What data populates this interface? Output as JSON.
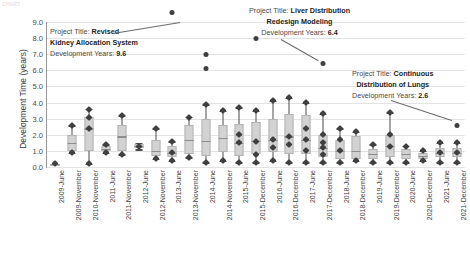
{
  "corner_text": "CHART",
  "chart_data": {
    "type": "box",
    "title": "",
    "xlabel": "",
    "ylabel": "Development Time (years)",
    "ylim": [
      0.0,
      9.0
    ],
    "yticks": [
      "0.0",
      "1.0",
      "2.0",
      "3.0",
      "4.0",
      "5.0",
      "6.0",
      "7.0",
      "8.0",
      "9.0"
    ],
    "grid": true,
    "legend": "none",
    "categories": [
      "2009-June",
      "2009-November",
      "2010-November",
      "2011-June",
      "2011-November",
      "2012-June",
      "2012-November",
      "2013-June",
      "2013-November",
      "2014-June",
      "2014-November",
      "2015-June",
      "2015-December",
      "2016-June",
      "2016-December",
      "2017-June",
      "2017-December",
      "2018-June",
      "2018-December",
      "2019-June",
      "2019-December",
      "2020-June",
      "2020-December",
      "2021-June",
      "2021-December"
    ],
    "boxes": [
      {
        "category": "2009-June",
        "whisker_low": 0.2,
        "q1": 0.2,
        "median": 0.2,
        "q3": 0.2,
        "whisker_high": 0.2,
        "points": [
          0.2
        ]
      },
      {
        "category": "2009-November",
        "whisker_low": 0.9,
        "q1": 1.0,
        "median": 1.5,
        "q3": 2.0,
        "whisker_high": 2.6,
        "points": [
          0.9,
          2.6
        ]
      },
      {
        "category": "2010-November",
        "whisker_low": 0.2,
        "q1": 1.0,
        "median": 2.4,
        "q3": 3.1,
        "whisker_high": 3.6,
        "points": [
          0.2,
          2.4,
          3.1,
          3.6
        ]
      },
      {
        "category": "2011-June",
        "whisker_low": 0.9,
        "q1": 1.0,
        "median": 1.1,
        "q3": 1.3,
        "whisker_high": 1.4,
        "points": [
          0.9,
          1.4
        ]
      },
      {
        "category": "2011-November",
        "whisker_low": 0.8,
        "q1": 1.0,
        "median": 1.9,
        "q3": 2.6,
        "whisker_high": 3.2,
        "points": [
          0.8,
          3.2
        ]
      },
      {
        "category": "2012-June",
        "whisker_low": 1.1,
        "q1": 1.2,
        "median": 1.3,
        "q3": 1.4,
        "whisker_high": 1.5,
        "points": [
          1.3
        ]
      },
      {
        "category": "2012-November",
        "whisker_low": 0.5,
        "q1": 0.7,
        "median": 1.0,
        "q3": 1.7,
        "whisker_high": 2.4,
        "points": [
          0.5,
          2.4
        ]
      },
      {
        "category": "2013-June",
        "whisker_low": 0.4,
        "q1": 0.6,
        "median": 0.9,
        "q3": 1.3,
        "whisker_high": 1.6,
        "points": [
          0.4,
          0.9,
          1.6,
          9.6
        ]
      },
      {
        "category": "2013-November",
        "whisker_low": 0.6,
        "q1": 0.8,
        "median": 1.7,
        "q3": 2.6,
        "whisker_high": 3.1,
        "points": [
          0.6,
          3.1
        ]
      },
      {
        "category": "2014-June",
        "whisker_low": 0.3,
        "q1": 0.7,
        "median": 1.6,
        "q3": 3.0,
        "whisker_high": 3.9,
        "points": [
          0.3,
          3.9,
          6.1,
          7.0
        ]
      },
      {
        "category": "2014-November",
        "whisker_low": 0.4,
        "q1": 0.9,
        "median": 1.8,
        "q3": 2.6,
        "whisker_high": 3.5,
        "points": [
          0.4,
          3.5
        ]
      },
      {
        "category": "2015-June",
        "whisker_low": 0.3,
        "q1": 0.7,
        "median": 1.5,
        "q3": 2.7,
        "whisker_high": 3.7,
        "points": [
          0.3,
          1.5,
          2.0,
          3.7
        ]
      },
      {
        "category": "2015-December",
        "whisker_low": 0.3,
        "q1": 0.8,
        "median": 1.6,
        "q3": 2.8,
        "whisker_high": 3.5,
        "points": [
          0.3,
          0.8,
          1.6,
          3.5,
          8.0
        ]
      },
      {
        "category": "2016-June",
        "whisker_low": 0.4,
        "q1": 0.9,
        "median": 1.7,
        "q3": 3.0,
        "whisker_high": 4.1,
        "points": [
          0.4,
          1.2,
          1.7,
          4.1
        ]
      },
      {
        "category": "2016-December",
        "whisker_low": 0.3,
        "q1": 0.8,
        "median": 1.9,
        "q3": 3.3,
        "whisker_high": 4.3,
        "points": [
          0.3,
          1.4,
          1.9,
          4.3
        ]
      },
      {
        "category": "2017-June",
        "whisker_low": 0.3,
        "q1": 0.8,
        "median": 1.7,
        "q3": 3.2,
        "whisker_high": 4.0,
        "points": [
          0.3,
          1.0,
          1.7,
          2.4,
          4.0
        ]
      },
      {
        "category": "2017-December",
        "whisker_low": 0.3,
        "q1": 0.6,
        "median": 1.2,
        "q3": 2.0,
        "whisker_high": 3.3,
        "points": [
          0.3,
          0.8,
          1.2,
          1.5,
          2.0,
          3.3,
          6.4
        ]
      },
      {
        "category": "2018-June",
        "whisker_low": 0.3,
        "q1": 0.5,
        "median": 1.0,
        "q3": 1.7,
        "whisker_high": 2.4,
        "points": [
          0.3,
          1.0,
          1.7,
          2.4
        ]
      },
      {
        "category": "2018-December",
        "whisker_low": 0.4,
        "q1": 0.5,
        "median": 1.0,
        "q3": 1.9,
        "whisker_high": 2.2,
        "points": [
          0.4,
          2.2
        ]
      },
      {
        "category": "2019-June",
        "whisker_low": 0.3,
        "q1": 0.5,
        "median": 0.8,
        "q3": 1.1,
        "whisker_high": 1.4,
        "points": [
          0.3,
          1.4
        ]
      },
      {
        "category": "2019-December",
        "whisker_low": 0.3,
        "q1": 0.6,
        "median": 1.3,
        "q3": 2.0,
        "whisker_high": 3.4,
        "points": [
          0.3,
          1.3,
          2.0,
          3.4
        ]
      },
      {
        "category": "2020-June",
        "whisker_low": 0.3,
        "q1": 0.5,
        "median": 0.8,
        "q3": 1.1,
        "whisker_high": 1.3,
        "points": [
          0.3,
          1.3
        ]
      },
      {
        "category": "2020-December",
        "whisker_low": 0.4,
        "q1": 0.5,
        "median": 0.7,
        "q3": 0.9,
        "whisker_high": 1.0,
        "points": [
          0.4,
          1.0
        ]
      },
      {
        "category": "2021-June",
        "whisker_low": 0.3,
        "q1": 0.6,
        "median": 0.9,
        "q3": 1.2,
        "whisker_high": 1.5,
        "points": [
          0.3,
          0.9,
          1.5
        ]
      },
      {
        "category": "2021-December",
        "whisker_low": 0.3,
        "q1": 0.6,
        "median": 0.9,
        "q3": 1.2,
        "whisker_high": 1.5,
        "points": [
          0.3,
          0.9,
          1.5,
          2.6
        ]
      }
    ],
    "annotations": [
      {
        "id": "kidney",
        "label_prefix": "Project Title:",
        "title_bold": "Revised",
        "title_line2": "Kidney Allocation System",
        "years_prefix": "Development Years:",
        "years_value": "9.6",
        "target_category": "2013-June",
        "target_value": 9.6
      },
      {
        "id": "liver",
        "label_prefix": "Project Title:",
        "title_bold": "Liver Distribution",
        "title_line2": "Redesign Modeling",
        "years_prefix": "Development Years:",
        "years_value": "6.4",
        "target_category": "2017-December",
        "target_value": 6.4
      },
      {
        "id": "lungs",
        "label_prefix": "Project Title:",
        "title_bold": "Continuous",
        "title_line2": "Distribution of Lungs",
        "years_prefix": "Development Years:",
        "years_value": "2.6",
        "target_category": "2021-December",
        "target_value": 2.6
      }
    ]
  }
}
